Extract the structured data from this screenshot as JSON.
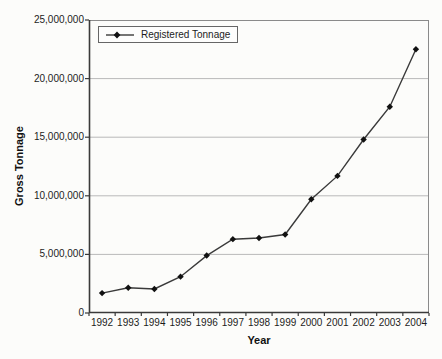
{
  "figure": {
    "legend_label": "Registered Tonnage"
  },
  "chart_data": {
    "type": "line",
    "title": "",
    "categories": [
      "1992",
      "1993",
      "1994",
      "1995",
      "1996",
      "1997",
      "1998",
      "1999",
      "2000",
      "2001",
      "2002",
      "2003",
      "2004"
    ],
    "series": [
      {
        "name": "Registered Tonnage",
        "values": [
          1700000,
          2150000,
          2050000,
          3100000,
          4900000,
          6300000,
          6400000,
          6700000,
          9700000,
          11700000,
          14800000,
          17600000,
          22500000
        ]
      }
    ],
    "xlabel": "Year",
    "ylabel": "Gross Tonnage",
    "ylim": [
      0,
      25000000
    ],
    "ytick_interval": 5000000,
    "ytick_labels": [
      "0",
      "5,000,000",
      "10,000,000",
      "15,000,000",
      "20,000,000",
      "25,000,000"
    ],
    "grid": true,
    "legend_position": "top-left-inside",
    "marker": "diamond",
    "colors": {
      "background": "#fcfcfa",
      "line": "#3a3a3a",
      "marker": "#111111",
      "grid": "#b9b9b9",
      "border": "#8a8a8a",
      "axis": "#3a3a3a",
      "text": "#1c1c1c"
    }
  }
}
